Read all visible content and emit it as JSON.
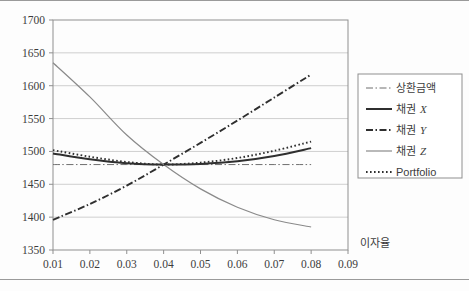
{
  "chart_data": {
    "type": "line",
    "title": "",
    "xlabel": "이자율",
    "ylabel": "",
    "xlim": [
      0.01,
      0.09
    ],
    "ylim": [
      1350,
      1700
    ],
    "xticks": [
      "0.01",
      "0.02",
      "0.03",
      "0.04",
      "0.05",
      "0.06",
      "0.07",
      "0.08",
      "0.09"
    ],
    "yticks": [
      "1350",
      "1400",
      "1450",
      "1500",
      "1550",
      "1600",
      "1650",
      "1700"
    ],
    "grid": "horizontal",
    "legend_position": "right",
    "x": [
      0.01,
      0.02,
      0.03,
      0.04,
      0.05,
      0.06,
      0.07,
      0.08
    ],
    "series": [
      {
        "name": "상환금액",
        "style": "dash-dot",
        "color": "#6e6e6e",
        "values": [
          1480,
          1480,
          1480,
          1480,
          1480,
          1480,
          1480,
          1480
        ]
      },
      {
        "name": "채권 X",
        "style": "solid-thick",
        "color": "#2f2f2f",
        "values": [
          1497,
          1488,
          1482,
          1480,
          1481,
          1485,
          1493,
          1505
        ]
      },
      {
        "name": "채권 Y",
        "style": "dash-dot-thick",
        "color": "#2f2f2f",
        "values": [
          1396,
          1420,
          1448,
          1480,
          1513,
          1547,
          1582,
          1617
        ]
      },
      {
        "name": "채권 Z",
        "style": "solid-thin",
        "color": "#8a8a8a",
        "values": [
          1635,
          1583,
          1525,
          1480,
          1443,
          1415,
          1396,
          1385
        ]
      },
      {
        "name": "Portfolio",
        "style": "dotted",
        "color": "#2f2f2f",
        "values": [
          1502,
          1492,
          1484,
          1480,
          1483,
          1490,
          1501,
          1515
        ]
      }
    ],
    "legend": [
      {
        "label": "상환금액",
        "italic_suffix": ""
      },
      {
        "label": "채권 ",
        "italic_suffix": "X"
      },
      {
        "label": "채권 ",
        "italic_suffix": "Y"
      },
      {
        "label": "채권 ",
        "italic_suffix": "Z"
      },
      {
        "label": "Portfolio",
        "italic_suffix": ""
      }
    ]
  }
}
